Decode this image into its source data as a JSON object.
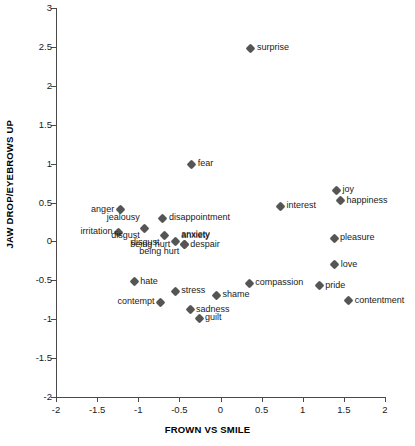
{
  "chart_data": {
    "type": "scatter",
    "title": "",
    "xlabel": "FROWN VS SMILE",
    "ylabel": "JAW DROP/EYEBROWS UP",
    "xlim": [
      -2,
      2
    ],
    "ylim": [
      -2,
      3
    ],
    "xticks": [
      -2,
      -1.5,
      -1,
      -0.5,
      0,
      0.5,
      1,
      1.5,
      2
    ],
    "xticklabels": [
      "-2",
      "-1.5",
      "-1",
      "-0.5",
      "0",
      "0.5",
      "1",
      "1.5",
      "2"
    ],
    "yticks": [
      3,
      2.5,
      2,
      1.5,
      1,
      0.5,
      0,
      -0.5,
      -1,
      -1.5,
      -2
    ],
    "yticklabels": [
      "3",
      "2.5",
      "2",
      "1.5",
      "1",
      "0.5",
      "0",
      "-0.5",
      "-1",
      "-1.5",
      "-2"
    ],
    "grid": false,
    "legend": "none",
    "marker_color": "#555555",
    "axis_color": "#4a4a4a",
    "points": [
      {
        "label": "surprise",
        "x": 0.37,
        "y": 2.48,
        "pos": "right"
      },
      {
        "label": "fear",
        "x": -0.35,
        "y": 0.99,
        "pos": "right"
      },
      {
        "label": "joy",
        "x": 1.41,
        "y": 0.66,
        "pos": "right"
      },
      {
        "label": "happiness",
        "x": 1.46,
        "y": 0.52,
        "pos": "right"
      },
      {
        "label": "interest",
        "x": 0.73,
        "y": 0.45,
        "pos": "right"
      },
      {
        "label": "anger",
        "x": -1.22,
        "y": 0.41,
        "pos": "left"
      },
      {
        "label": "jealousy",
        "x": -0.92,
        "y": 0.17,
        "pos": "none"
      },
      {
        "label": "disappointment",
        "x": -0.7,
        "y": 0.3,
        "pos": "right"
      },
      {
        "label": "irritation",
        "x": -1.24,
        "y": 0.12,
        "pos": "left"
      },
      {
        "label": "disgust",
        "x": -0.68,
        "y": 0.07,
        "pos": "belowleft"
      },
      {
        "label": "anxiety",
        "x": -0.55,
        "y": 0.0,
        "pos": "above"
      },
      {
        "label": "being hurt",
        "x": -0.44,
        "y": -0.04,
        "pos": "belowleft"
      },
      {
        "label": "despair",
        "x": -0.44,
        "y": -0.04,
        "pos": "right"
      },
      {
        "label": "pleasure",
        "x": 1.38,
        "y": 0.04,
        "pos": "right"
      },
      {
        "label": "love",
        "x": 1.39,
        "y": -0.3,
        "pos": "right"
      },
      {
        "label": "hate",
        "x": -1.05,
        "y": -0.52,
        "pos": "right"
      },
      {
        "label": "compassion",
        "x": 0.35,
        "y": -0.54,
        "pos": "right"
      },
      {
        "label": "pride",
        "x": 1.2,
        "y": -0.57,
        "pos": "right"
      },
      {
        "label": "stress",
        "x": -0.55,
        "y": -0.64,
        "pos": "right"
      },
      {
        "label": "shame",
        "x": -0.05,
        "y": -0.69,
        "pos": "right"
      },
      {
        "label": "contentment",
        "x": 1.56,
        "y": -0.76,
        "pos": "right"
      },
      {
        "label": "contempt",
        "x": -0.73,
        "y": -0.78,
        "pos": "left"
      },
      {
        "label": "sadness",
        "x": -0.37,
        "y": -0.88,
        "pos": "right"
      },
      {
        "label": "guilt",
        "x": -0.26,
        "y": -0.99,
        "pos": "right"
      }
    ],
    "extra_labels": [
      {
        "label": "jealousy",
        "x": -0.92,
        "y": 0.3,
        "align": "left"
      },
      {
        "label": "disgust",
        "x": -0.92,
        "y": 0.07,
        "align": "left"
      },
      {
        "label": "anxiety",
        "x": -0.55,
        "y": 0.07,
        "align": "right"
      },
      {
        "label": "being hurt",
        "x": -0.55,
        "y": -0.04,
        "align": "left"
      }
    ]
  }
}
